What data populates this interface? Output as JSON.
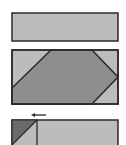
{
  "diagram": {
    "colors": {
      "background": "#ffffff",
      "light_fill": "#bcbcbc",
      "mid_fill": "#8e8e8e",
      "dark_fill": "#6a6a6a",
      "stroke": "#2a2a2a"
    },
    "panels": [
      {
        "name": "top-rectangle",
        "x": 12,
        "y": 13,
        "w": 106,
        "h": 28
      },
      {
        "name": "middle-rectangle-with-hexagon",
        "x": 12,
        "y": 50,
        "w": 106,
        "h": 54,
        "hexagon_points": "12,88 51,50 92,50 118,77 92,104 12,104"
      },
      {
        "name": "bottom-partial-rectangle",
        "x": 12,
        "y": 120,
        "w": 106,
        "h": 30,
        "divider_x": 37,
        "triangle_points": "12,120 37,120 12,145"
      }
    ],
    "arrow": {
      "direction": "left",
      "x1": 46,
      "x2": 32,
      "y": 115
    }
  }
}
